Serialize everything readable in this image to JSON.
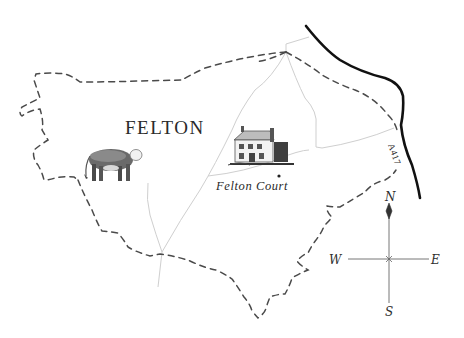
{
  "map": {
    "title": "FELTON",
    "places": [
      {
        "name": "Felton Court",
        "marker": "dot"
      }
    ],
    "roads": [
      {
        "label": "A417",
        "style": "bold-black-line"
      }
    ],
    "illustrations": [
      {
        "name": "hereford-bull-illustration",
        "subject": "bull"
      },
      {
        "name": "felton-court-house-illustration",
        "subject": "manor house"
      }
    ],
    "legend_styles": {
      "parish_boundary": "dashed",
      "lanes": "thin-grey",
      "main_road": "thick-black"
    },
    "colors": {
      "background": "#ffffff",
      "boundary": "#4a4a4a",
      "lanes": "#cfcfcf",
      "main_road": "#111111",
      "text": "#2a2a2a"
    }
  },
  "compass": {
    "north": "N",
    "south": "S",
    "east": "E",
    "west": "W"
  }
}
